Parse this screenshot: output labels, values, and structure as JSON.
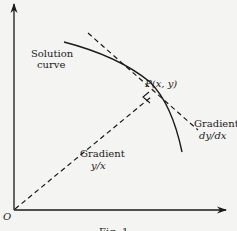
{
  "diagram": {
    "type": "geometry-figure",
    "caption": "Fig. 1",
    "origin_label": "O",
    "point_label": "P(x, y)",
    "curve_label_line1": "Solution",
    "curve_label_line2": "curve",
    "tangent_label_line1": "Gradient",
    "tangent_label_line2": "dy/dx",
    "radial_label_line1": "Gradient",
    "radial_label_line2": "y/x",
    "colors": {
      "background": "#f4f4f2",
      "ink": "#1a1a1a"
    },
    "elements": [
      {
        "name": "x-axis",
        "style": "solid",
        "arrow": true
      },
      {
        "name": "y-axis",
        "style": "solid",
        "arrow": true
      },
      {
        "name": "solution-curve",
        "style": "solid"
      },
      {
        "name": "tangent-line",
        "style": "dashed",
        "through": "P"
      },
      {
        "name": "radial-line",
        "style": "dashed",
        "from": "O",
        "to": "P"
      },
      {
        "name": "right-angle-marker",
        "at": "P",
        "between": [
          "tangent-line",
          "radial-line"
        ]
      }
    ]
  }
}
